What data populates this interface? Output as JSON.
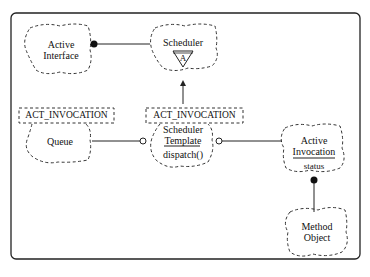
{
  "diagram": {
    "type": "Booch class diagram",
    "classes": {
      "active_interface": {
        "line1": "Active",
        "line2": "Interface"
      },
      "scheduler": {
        "name": "Scheduler",
        "adornment": "A"
      },
      "queue": {
        "name": "Queue",
        "template_param": "ACT_INVOCATION"
      },
      "scheduler_template": {
        "line1": "Scheduler",
        "line2": "Template",
        "operation": "dispatch()",
        "template_param": "ACT_INVOCATION"
      },
      "active_invocation": {
        "line1": "Active",
        "line2": "Invocation",
        "attribute": "status"
      },
      "method_object": {
        "line1": "Method",
        "line2": "Object"
      }
    },
    "relationships": [
      {
        "from": "Active Interface",
        "to": "Scheduler",
        "kind": "has (filled circle at Active Interface)"
      },
      {
        "from": "Scheduler Template",
        "to": "Scheduler",
        "kind": "inheritance (arrow up)"
      },
      {
        "from": "Scheduler Template",
        "to": "Queue",
        "kind": "uses (open circle at Scheduler Template)"
      },
      {
        "from": "Scheduler Template",
        "to": "Active Invocation",
        "kind": "uses (open circle at Scheduler Template)"
      },
      {
        "from": "Active Invocation",
        "to": "Method Object",
        "kind": "has (filled circle at Active Invocation)"
      }
    ]
  }
}
